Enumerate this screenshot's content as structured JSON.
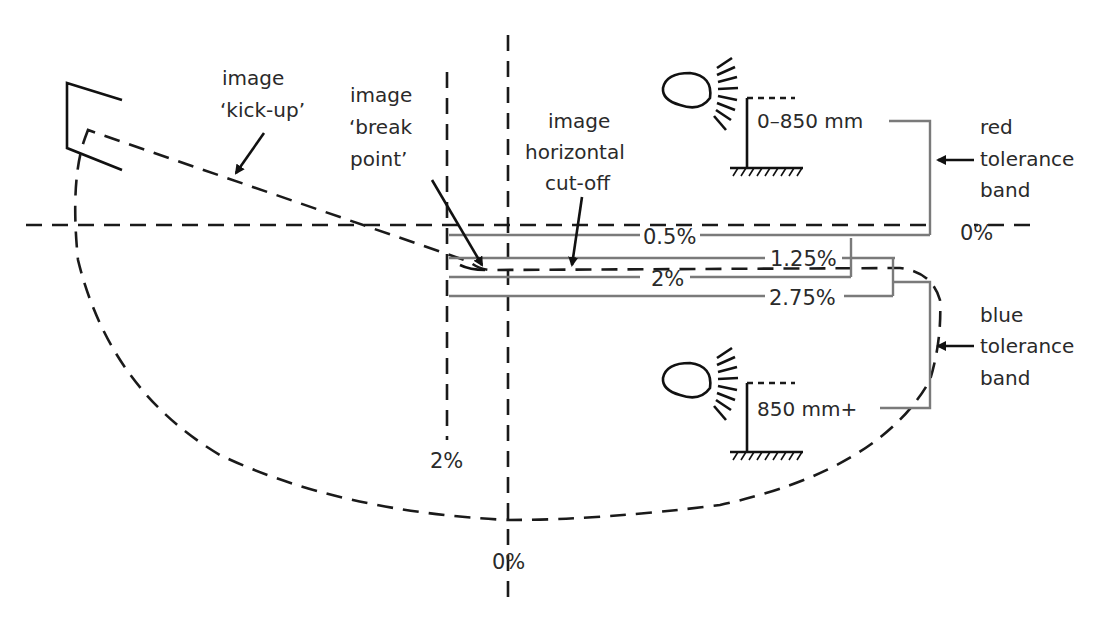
{
  "diagram": {
    "type": "headlamp beam pattern with aim tolerance bands",
    "labels": {
      "kick_up": {
        "line1": "image",
        "line2": "‘kick-up’"
      },
      "break_point": {
        "line1": "image",
        "line2": "‘break",
        "line3": "point’"
      },
      "horizontal_cutoff": {
        "line1": "image",
        "line2": "horizontal",
        "line3": "cut-off"
      },
      "red_band": {
        "line1": "red",
        "line2": "tolerance",
        "line3": "band"
      },
      "blue_band": {
        "line1": "blue",
        "line2": "tolerance",
        "line3": "band"
      }
    },
    "mounting_heights": {
      "low": "0–850 mm",
      "high": "850 mm+"
    },
    "percentages": {
      "horizontal_zero": "0%",
      "vertical_zero": "0%",
      "vertical_left": "2%",
      "p0_5": "0.5%",
      "p1_25": "1.25%",
      "p2": "2%",
      "p2_75": "2.75%"
    },
    "colors": {
      "line": "#1a1a1a",
      "band_line": "#7a7a7a",
      "text": "#2a2a2a",
      "background": "#ffffff"
    }
  }
}
